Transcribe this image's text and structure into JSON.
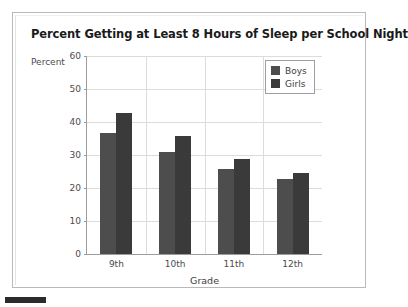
{
  "figure": {
    "title": "Percent Getting at Least 8 Hours of Sleep per School Night",
    "y_axis_caption": "Percent",
    "x_axis_title": "Grade"
  },
  "legend": {
    "items": [
      {
        "label": "Boys",
        "color": "#4d4d4d"
      },
      {
        "label": "Girls",
        "color": "#3a3a3a"
      }
    ]
  },
  "chart_data": {
    "type": "bar",
    "title": "Percent Getting at Least 8 Hours of Sleep per School Night",
    "xlabel": "Grade",
    "ylabel": "Percent",
    "categories": [
      "9th",
      "10th",
      "11th",
      "12th"
    ],
    "series": [
      {
        "name": "Boys",
        "color": "#4d4d4d",
        "values": [
          36.7,
          30.9,
          25.7,
          22.7
        ]
      },
      {
        "name": "Girls",
        "color": "#3a3a3a",
        "values": [
          42.7,
          35.8,
          28.7,
          24.5
        ]
      }
    ],
    "ylim": [
      0,
      60
    ],
    "ytick_values": [
      0,
      10,
      20,
      30,
      40,
      50,
      60
    ],
    "ytick_labels": [
      "0",
      "10",
      "20",
      "30",
      "40",
      "50",
      "60"
    ],
    "grid": "horizontal-and-category-separators",
    "legend_position": "top-right-inside"
  }
}
